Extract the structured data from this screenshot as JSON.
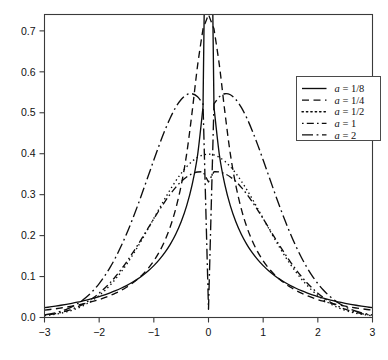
{
  "chart_data": {
    "type": "line",
    "title": "",
    "subtitle": "",
    "xlabel": "",
    "ylabel": "",
    "xlim": [
      -3,
      3
    ],
    "ylim": [
      0,
      0.74
    ],
    "grid": false,
    "legend_position": "top-right",
    "xticks": [
      -3,
      -2,
      -1,
      0,
      1,
      2,
      3
    ],
    "xtick_labels": [
      "-3",
      "-2",
      "-1",
      "0",
      "1",
      "2",
      "3"
    ],
    "yticks": [
      0.0,
      0.1,
      0.2,
      0.3,
      0.4,
      0.5,
      0.6,
      0.7
    ],
    "ytick_labels": [
      "0.0",
      "0.1",
      "0.2",
      "0.3",
      "0.4",
      "0.5",
      "0.6",
      "0.7"
    ],
    "x": [
      -3.0,
      -2.9,
      -2.8,
      -2.7,
      -2.6,
      -2.5,
      -2.4,
      -2.3,
      -2.2,
      -2.1,
      -2.0,
      -1.9,
      -1.8,
      -1.7,
      -1.6,
      -1.5,
      -1.4,
      -1.3,
      -1.2,
      -1.1,
      -1.0,
      -0.9,
      -0.8,
      -0.7,
      -0.6,
      -0.5,
      -0.4,
      -0.3,
      -0.2,
      -0.1,
      0.0,
      0.1,
      0.2,
      0.3,
      0.4,
      0.5,
      0.6,
      0.7,
      0.8,
      0.9,
      1.0,
      1.1,
      1.2,
      1.3,
      1.4,
      1.5,
      1.6,
      1.7,
      1.8,
      1.9,
      2.0,
      2.1,
      2.2,
      2.3,
      2.4,
      2.5,
      2.6,
      2.7,
      2.8,
      2.9,
      3.0
    ],
    "series": [
      {
        "name": "a = 1/8",
        "label": "a = 1/8",
        "dash": "solid",
        "peak_x": 0.0,
        "peak_y": 1.6,
        "clipped_at_top": true,
        "values": [
          0.024,
          0.0258,
          0.0278,
          0.0299,
          0.0322,
          0.0347,
          0.0374,
          0.0404,
          0.0436,
          0.0472,
          0.0511,
          0.0554,
          0.0602,
          0.0655,
          0.0714,
          0.078,
          0.0854,
          0.0938,
          0.1033,
          0.1142,
          0.1267,
          0.1413,
          0.1584,
          0.1788,
          0.2035,
          0.234,
          0.2727,
          0.3238,
          0.3962,
          0.514,
          1.6,
          0.514,
          0.3962,
          0.3238,
          0.2727,
          0.234,
          0.2035,
          0.1788,
          0.1584,
          0.1413,
          0.1267,
          0.1142,
          0.1033,
          0.0938,
          0.0854,
          0.078,
          0.0714,
          0.0655,
          0.0602,
          0.0554,
          0.0511,
          0.0472,
          0.0436,
          0.0404,
          0.0374,
          0.0347,
          0.0322,
          0.0299,
          0.0278,
          0.0258,
          0.024
        ]
      },
      {
        "name": "a = 1/4",
        "label": "a = 1/4",
        "dash": "dashed",
        "peak_x": 0.0,
        "peak_y": 0.74,
        "clipped_at_top": true,
        "values": [
          0.018,
          0.0196,
          0.0213,
          0.0232,
          0.0253,
          0.0276,
          0.0302,
          0.033,
          0.0362,
          0.0398,
          0.0438,
          0.0484,
          0.0535,
          0.0594,
          0.0661,
          0.0739,
          0.0829,
          0.0934,
          0.1058,
          0.1206,
          0.1384,
          0.1602,
          0.1873,
          0.2214,
          0.2652,
          0.3226,
          0.399,
          0.5015,
          0.615,
          0.705,
          0.74,
          0.705,
          0.615,
          0.5015,
          0.399,
          0.3226,
          0.2652,
          0.2214,
          0.1873,
          0.1602,
          0.1384,
          0.1206,
          0.1058,
          0.0934,
          0.0829,
          0.0739,
          0.0661,
          0.0594,
          0.0535,
          0.0484,
          0.0438,
          0.0398,
          0.0362,
          0.033,
          0.0302,
          0.0276,
          0.0253,
          0.0232,
          0.0213,
          0.0196,
          0.018
        ]
      },
      {
        "name": "a = 1/2",
        "label": "a = 1/2",
        "dash": "dotted",
        "peak_x": 0.0,
        "peak_y": 0.399,
        "clipped_at_top": false,
        "values": [
          0.0044,
          0.006,
          0.0079,
          0.0104,
          0.0136,
          0.0175,
          0.0224,
          0.0283,
          0.0355,
          0.044,
          0.054,
          0.0656,
          0.079,
          0.094,
          0.1109,
          0.1295,
          0.1497,
          0.1714,
          0.1942,
          0.2179,
          0.242,
          0.2661,
          0.2897,
          0.3123,
          0.3332,
          0.3521,
          0.3683,
          0.3814,
          0.391,
          0.397,
          0.3989,
          0.397,
          0.391,
          0.3814,
          0.3683,
          0.3521,
          0.3332,
          0.3123,
          0.2897,
          0.2661,
          0.242,
          0.2179,
          0.1942,
          0.1714,
          0.1497,
          0.1295,
          0.1109,
          0.094,
          0.079,
          0.0656,
          0.054,
          0.044,
          0.0355,
          0.0283,
          0.0224,
          0.0175,
          0.0136,
          0.0104,
          0.0079,
          0.006,
          0.0044
        ]
      },
      {
        "name": "a = 1",
        "label": "a = 1",
        "dash": "dashdot-short",
        "bimodal": true,
        "peak_x": [
          -0.52,
          0.52
        ],
        "peak_y": 0.443,
        "center_y": 0.331,
        "clipped_at_top": false,
        "values": [
          0.0053,
          0.0071,
          0.0094,
          0.0123,
          0.0159,
          0.0203,
          0.0257,
          0.0322,
          0.0399,
          0.0489,
          0.0594,
          0.0714,
          0.085,
          0.1002,
          0.1171,
          0.1354,
          0.1551,
          0.1759,
          0.1974,
          0.2193,
          0.2411,
          0.2624,
          0.2826,
          0.3013,
          0.3179,
          0.332,
          0.3432,
          0.351,
          0.3553,
          0.356,
          0.331,
          0.356,
          0.3553,
          0.351,
          0.3432,
          0.332,
          0.3179,
          0.3013,
          0.2826,
          0.2624,
          0.2411,
          0.2193,
          0.1974,
          0.1759,
          0.1551,
          0.1354,
          0.1171,
          0.1002,
          0.085,
          0.0714,
          0.0594,
          0.0489,
          0.0399,
          0.0322,
          0.0257,
          0.0203,
          0.0159,
          0.0123,
          0.0094,
          0.0071,
          0.0053
        ]
      },
      {
        "name": "a = 2",
        "label": "a = 2",
        "dash": "dashdot-long",
        "bimodal": true,
        "peak_x": [
          -0.85,
          0.85
        ],
        "peak_y": 0.578,
        "center_y": 0.02,
        "clipped_at_top": false,
        "values": [
          0.0062,
          0.0085,
          0.0115,
          0.0153,
          0.0201,
          0.0261,
          0.0336,
          0.0427,
          0.0538,
          0.0671,
          0.0828,
          0.1012,
          0.1224,
          0.1466,
          0.1738,
          0.2039,
          0.2367,
          0.2718,
          0.3087,
          0.3466,
          0.3846,
          0.4216,
          0.4563,
          0.4873,
          0.5132,
          0.5325,
          0.544,
          0.5465,
          0.5392,
          0.5215,
          0.02,
          0.5215,
          0.5392,
          0.5465,
          0.544,
          0.5325,
          0.5132,
          0.4873,
          0.4563,
          0.4216,
          0.3846,
          0.3466,
          0.3087,
          0.2718,
          0.2367,
          0.2039,
          0.1738,
          0.1466,
          0.1224,
          0.1012,
          0.0828,
          0.0671,
          0.0538,
          0.0427,
          0.0336,
          0.0261,
          0.0201,
          0.0153,
          0.0115,
          0.0085,
          0.0062
        ]
      }
    ]
  },
  "legend": {
    "entries": [
      {
        "label": "a = 1/8",
        "param": "a",
        "value": "1/8"
      },
      {
        "label": "a = 1/4",
        "param": "a",
        "value": "1/4"
      },
      {
        "label": "a = 1/2",
        "param": "a",
        "value": "1/2"
      },
      {
        "label": "a = 1",
        "param": "a",
        "value": "1"
      },
      {
        "label": "a = 2",
        "param": "a",
        "value": "2"
      }
    ]
  }
}
